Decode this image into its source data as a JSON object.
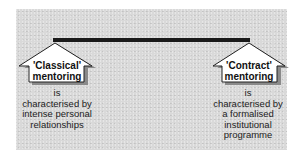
{
  "diagram": {
    "connector": {
      "type": "horizontal-bar",
      "color": "#1a1a1a"
    },
    "background_color": "#d9d9d9",
    "nodes": [
      {
        "id": "classical",
        "title_line1": "'Classical'",
        "title_line2": "mentoring",
        "desc_line1": "is",
        "desc_line2": "characterised by",
        "desc_line3": "intense personal",
        "desc_line4": "relationships",
        "desc_line5": ""
      },
      {
        "id": "contract",
        "title_line1": "'Contract'",
        "title_line2": "mentoring",
        "desc_line1": "is",
        "desc_line2": "characterised by",
        "desc_line3": "a formalised",
        "desc_line4": "institutional",
        "desc_line5": "programme"
      }
    ]
  }
}
